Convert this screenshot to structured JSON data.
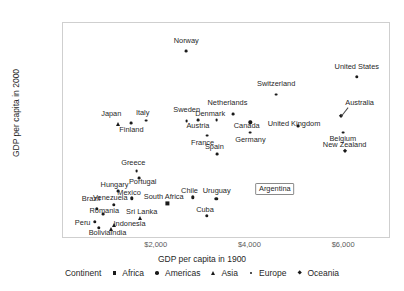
{
  "chart_data": {
    "type": "scatter",
    "title": "",
    "xlabel": "GDP per capita in 1900",
    "ylabel": "GDP per capita in 2000",
    "xlim": [
      0,
      7000
    ],
    "ylim": [
      0,
      66000
    ],
    "xticks": [
      "$2,000",
      "$4,000",
      "$6,000"
    ],
    "xtick_values": [
      2000,
      4000,
      6000
    ],
    "yticks": [
      "$0",
      "$20,000",
      "$40,000",
      "$60,000"
    ],
    "ytick_values": [
      0,
      20000,
      40000,
      60000
    ],
    "grid": false,
    "legend_position": "bottom",
    "legend_title": "Continent",
    "series": [
      {
        "name": "Africa",
        "marker": "square"
      },
      {
        "name": "Americas",
        "marker": "circle"
      },
      {
        "name": "Asia",
        "marker": "triangle"
      },
      {
        "name": "Europe",
        "marker": "dot"
      },
      {
        "name": "Oceania",
        "marker": "diamond"
      }
    ],
    "points": [
      {
        "label": "Norway",
        "continent": "Europe",
        "marker": "dot",
        "x": 2630,
        "y": 57400,
        "lx": 2630,
        "ly": 60600,
        "align": "c"
      },
      {
        "label": "United States",
        "continent": "Americas",
        "marker": "circle",
        "x": 6270,
        "y": 49600,
        "lx": 6270,
        "ly": 52700,
        "align": "c"
      },
      {
        "label": "Switzerland",
        "continent": "Europe",
        "marker": "dot",
        "x": 4550,
        "y": 44100,
        "lx": 4550,
        "ly": 47300,
        "align": "c"
      },
      {
        "label": "Australia",
        "continent": "Oceania",
        "marker": "diamond",
        "x": 5930,
        "y": 37700,
        "lx": 6330,
        "ly": 41600,
        "align": "c"
      },
      {
        "label": "Netherlands",
        "continent": "Europe",
        "marker": "dot",
        "x": 3630,
        "y": 38100,
        "lx": 3510,
        "ly": 41500,
        "align": "c"
      },
      {
        "label": "Denmark",
        "continent": "Europe",
        "marker": "dot",
        "x": 3280,
        "y": 36400,
        "lx": 3140,
        "ly": 38100,
        "align": "c"
      },
      {
        "label": "Sweden",
        "continent": "Europe",
        "marker": "dot",
        "x": 2640,
        "y": 36000,
        "lx": 2640,
        "ly": 39300,
        "align": "c"
      },
      {
        "label": "Canada",
        "continent": "Americas",
        "marker": "circle",
        "x": 4000,
        "y": 35600,
        "lx": 3920,
        "ly": 34500,
        "align": "c"
      },
      {
        "label": "United Kingdom",
        "continent": "Europe",
        "marker": "dot",
        "x": 5010,
        "y": 34400,
        "lx": 4930,
        "ly": 35200,
        "align": "c"
      },
      {
        "label": "Italy",
        "continent": "Europe",
        "marker": "dot",
        "x": 1780,
        "y": 36200,
        "lx": 1700,
        "ly": 38500,
        "align": "c"
      },
      {
        "label": "Austria",
        "continent": "Europe",
        "marker": "dot",
        "x": 2880,
        "y": 36300,
        "lx": 2880,
        "ly": 34500,
        "align": "c"
      },
      {
        "label": "Japan",
        "continent": "Asia",
        "marker": "triangle",
        "x": 1180,
        "y": 35200,
        "lx": 1030,
        "ly": 38300,
        "align": "c"
      },
      {
        "label": "Finland",
        "continent": "Europe",
        "marker": "dot",
        "x": 1460,
        "y": 35400,
        "lx": 1460,
        "ly": 33200,
        "align": "c"
      },
      {
        "label": "Germany",
        "continent": "Europe",
        "marker": "dot",
        "x": 4000,
        "y": 32500,
        "lx": 4000,
        "ly": 30400,
        "align": "c"
      },
      {
        "label": "Belgium",
        "continent": "Europe",
        "marker": "dot",
        "x": 5970,
        "y": 32500,
        "lx": 5970,
        "ly": 30500,
        "align": "c"
      },
      {
        "label": "France",
        "continent": "Europe",
        "marker": "dot",
        "x": 3080,
        "y": 31600,
        "lx": 2980,
        "ly": 29200,
        "align": "c"
      },
      {
        "label": "New Zealand",
        "continent": "Oceania",
        "marker": "diamond",
        "x": 6010,
        "y": 26800,
        "lx": 6010,
        "ly": 28800,
        "align": "c"
      },
      {
        "label": "Spain",
        "continent": "Europe",
        "marker": "dot",
        "x": 3290,
        "y": 26000,
        "lx": 3230,
        "ly": 28000,
        "align": "c"
      },
      {
        "label": "Greece",
        "continent": "Europe",
        "marker": "dot",
        "x": 1570,
        "y": 20800,
        "lx": 1500,
        "ly": 23200,
        "align": "c"
      },
      {
        "label": "Portugal",
        "continent": "Europe",
        "marker": "dot",
        "x": 1630,
        "y": 18700,
        "lx": 1700,
        "ly": 17500,
        "align": "c"
      },
      {
        "label": "Argentina",
        "continent": "Americas",
        "marker": "circle",
        "x": 4300,
        "y": 14800,
        "lx": 4520,
        "ly": 15600,
        "align": "c"
      },
      {
        "label": "Hungary",
        "continent": "Europe",
        "marker": "dot",
        "x": 1170,
        "y": 14700,
        "lx": 1100,
        "ly": 16500,
        "align": "c"
      },
      {
        "label": "Chile",
        "continent": "Americas",
        "marker": "circle",
        "x": 2770,
        "y": 12700,
        "lx": 2700,
        "ly": 14600,
        "align": "c"
      },
      {
        "label": "Uruguay",
        "continent": "Americas",
        "marker": "circle",
        "x": 3270,
        "y": 12200,
        "lx": 3280,
        "ly": 14600,
        "align": "c"
      },
      {
        "label": "Mexico",
        "continent": "Americas",
        "marker": "circle",
        "x": 1470,
        "y": 12400,
        "lx": 1410,
        "ly": 14000,
        "align": "c"
      },
      {
        "label": "South Africa",
        "continent": "Africa",
        "marker": "square",
        "x": 2230,
        "y": 10900,
        "lx": 2150,
        "ly": 12900,
        "align": "c"
      },
      {
        "label": "Venezuela",
        "continent": "Americas",
        "marker": "circle",
        "x": 1080,
        "y": 10400,
        "lx": 1010,
        "ly": 12500,
        "align": "c"
      },
      {
        "label": "Brazil",
        "continent": "Americas",
        "marker": "circle",
        "x": 720,
        "y": 9200,
        "lx": 600,
        "ly": 12100,
        "align": "c"
      },
      {
        "label": "Romania",
        "continent": "Europe",
        "marker": "dot",
        "x": 850,
        "y": 7600,
        "lx": 880,
        "ly": 8700,
        "align": "c"
      },
      {
        "label": "Cuba",
        "continent": "Americas",
        "marker": "circle",
        "x": 3070,
        "y": 7100,
        "lx": 3030,
        "ly": 9000,
        "align": "c"
      },
      {
        "label": "Sri Lanka",
        "continent": "Asia",
        "marker": "triangle",
        "x": 1640,
        "y": 6500,
        "lx": 1680,
        "ly": 8300,
        "align": "c"
      },
      {
        "label": "Peru",
        "continent": "Americas",
        "marker": "circle",
        "x": 680,
        "y": 5200,
        "lx": 420,
        "ly": 5000,
        "align": "c"
      },
      {
        "label": "Indonesia",
        "continent": "Asia",
        "marker": "triangle",
        "x": 1090,
        "y": 4400,
        "lx": 1420,
        "ly": 4600,
        "align": "c"
      },
      {
        "label": "Bolivia",
        "continent": "Americas",
        "marker": "circle",
        "x": 760,
        "y": 3500,
        "lx": 780,
        "ly": 1700,
        "align": "c"
      },
      {
        "label": "India",
        "continent": "Asia",
        "marker": "triangle",
        "x": 1030,
        "y": 3100,
        "lx": 1180,
        "ly": 1700,
        "align": "c"
      }
    ],
    "highlighted_point": "Argentina"
  },
  "axis": {
    "x_title": "GDP per capita in 1900",
    "y_title": "GDP per capita in 2000"
  },
  "legend": {
    "title": "Continent",
    "entries": [
      {
        "label": "Africa",
        "marker": "square"
      },
      {
        "label": "Americas",
        "marker": "circle"
      },
      {
        "label": "Asia",
        "marker": "triangle"
      },
      {
        "label": "Europe",
        "marker": "dot"
      },
      {
        "label": "Oceania",
        "marker": "diamond"
      }
    ]
  },
  "colors": {
    "marker": "#1a1a1a",
    "panel_border": "#cfcfcf",
    "tick_text": "#5a5a5a",
    "label_text": "#1f1f1f",
    "tooltip_border": "#8a8a8a",
    "background": "#ffffff"
  }
}
